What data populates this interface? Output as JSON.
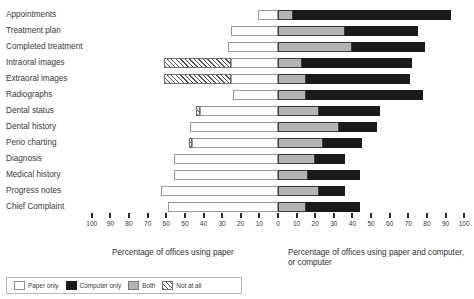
{
  "chart_data": {
    "type": "bar",
    "subtype": "diverging-stacked-horizontal",
    "title": "",
    "xlabel_left": "Percentage of offices using paper",
    "xlabel_right": "Percentage of offices using paper and computer, or computer",
    "ylabel": "",
    "grid": false,
    "legend_position": "bottom-left",
    "xlim_left": [
      0,
      100
    ],
    "xlim_right": [
      0,
      100
    ],
    "tick_labels_left": [
      "100",
      "90",
      "80",
      "70",
      "60",
      "50",
      "40",
      "30",
      "20",
      "10"
    ],
    "tick_labels_center": "0",
    "tick_labels_right": [
      "10",
      "20",
      "30",
      "40",
      "50",
      "60",
      "70",
      "80",
      "90",
      "100"
    ],
    "series": [
      {
        "name": "Not at all",
        "key": "not_at_all",
        "color": "#ffffff",
        "pattern": "diagonal-hatch"
      },
      {
        "name": "Paper only",
        "key": "paper_only",
        "color": "#ffffff"
      },
      {
        "name": "Both",
        "key": "both",
        "color": "#b4b4b4"
      },
      {
        "name": "Computer only",
        "key": "computer_only",
        "color": "#1a1a1a"
      }
    ],
    "categories": [
      "Appointments",
      "Treatment plan",
      "Completed treatment",
      "Intraoral images",
      "Extraoral images",
      "Radiographs",
      "Dental status",
      "Dental history",
      "Perio charting",
      "Diagnosis",
      "Medical history",
      "Progress notes",
      "Chief Complaint"
    ],
    "values": {
      "not_at_all": [
        0,
        0,
        0,
        36,
        36,
        0,
        2,
        0,
        2,
        0,
        0,
        0,
        0
      ],
      "paper_only": [
        11,
        25,
        27,
        25,
        25,
        24,
        42,
        47,
        46,
        56,
        56,
        63,
        59
      ],
      "both": [
        8,
        36,
        40,
        13,
        15,
        15,
        22,
        33,
        24,
        20,
        16,
        22,
        15
      ],
      "computer_only": [
        85,
        39,
        39,
        59,
        56,
        63,
        33,
        20,
        21,
        16,
        28,
        14,
        29
      ]
    },
    "note": "Left axis (paper side) shows Not at all + Paper only extending leftward from 0; right axis shows Both + Computer only extending rightward from 0."
  },
  "legend": {
    "items": [
      {
        "label": "Paper only",
        "swatch": "paper-swatch"
      },
      {
        "label": "Computer only",
        "swatch": "computer-swatch"
      },
      {
        "label": "Both",
        "swatch": "both-swatch"
      },
      {
        "label": "Not at all",
        "swatch": "not-at-all-swatch"
      }
    ]
  }
}
